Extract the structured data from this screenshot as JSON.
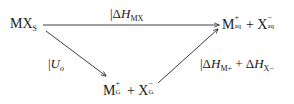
{
  "diagram": {
    "type": "thermodynamic-cycle",
    "nodes": {
      "solid": {
        "main": "MX",
        "subscript": "S"
      },
      "aqueous": {
        "cation": "M",
        "cation_sup": "+",
        "cation_sub": "aq",
        "plus": "+",
        "anion": "X",
        "anion_sup": "−",
        "anion_sub": "aq"
      },
      "gas": {
        "cation": "M",
        "cation_sup": "+",
        "cation_sub": "G",
        "plus": "+",
        "anion": "X",
        "anion_sup": "−",
        "anion_sub": "G"
      }
    },
    "edges": {
      "top": {
        "from": "solid",
        "to": "aqueous",
        "bar": "|",
        "delta": "Δ",
        "symbol": "H",
        "subscript": "MX"
      },
      "left": {
        "from": "solid",
        "to": "gas",
        "bar": "|",
        "symbol": "U",
        "subscript": "o"
      },
      "right": {
        "from": "gas",
        "to": "aqueous",
        "bar": "|",
        "delta1": "Δ",
        "symbol1": "H",
        "subscript1": "M+",
        "plus": "+",
        "delta2": "Δ",
        "symbol2": "H",
        "subscript2": "X−"
      }
    },
    "colors": {
      "line": "#2a2a2a",
      "text": "#1a1a1a",
      "background": "#ffffff"
    }
  }
}
